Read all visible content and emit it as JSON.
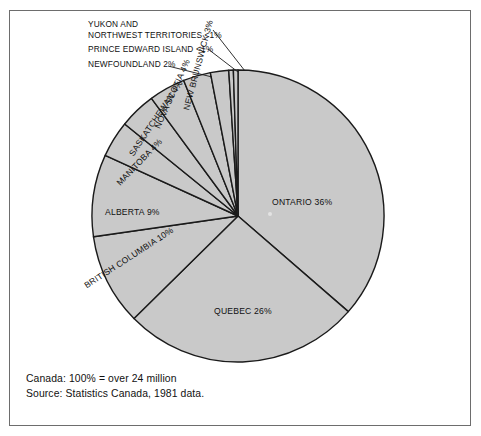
{
  "figure": {
    "border_color": "#6d6d6d",
    "background": "#ffffff"
  },
  "chart_data": {
    "type": "pie",
    "title": "",
    "subtitle": "",
    "units": "percent of population",
    "start_angle_deg": 0,
    "direction": "clockwise",
    "fill_color": "#c9c9c9",
    "stroke_color": "#1a1a1a",
    "center": {
      "x": 238,
      "y": 216
    },
    "radius": 146,
    "categories": [
      "ONTARIO",
      "QUEBEC",
      "BRITISH COLUMBIA",
      "ALBERTA",
      "MANITOBA",
      "SASKATCHEWAN",
      "NOVA SCOTIA",
      "NEW BRUNSWICK",
      "NEWFOUNDLAND",
      "PRINCE EDWARD ISLAND",
      "YUKON AND NORTHWEST TERRITORIES"
    ],
    "values": [
      36,
      26,
      10,
      9,
      4,
      4,
      4,
      3,
      2,
      0.5,
      0.5
    ],
    "value_labels": [
      "36%",
      "26%",
      "10%",
      "9%",
      "4%",
      "4%",
      "4%",
      "3%",
      "2%",
      "<1%",
      "<1%"
    ],
    "slices": [
      {
        "name": "ONTARIO",
        "value": 36,
        "label": "ONTARIO 36%"
      },
      {
        "name": "QUEBEC",
        "value": 26,
        "label": "QUEBEC 26%"
      },
      {
        "name": "BRITISH COLUMBIA",
        "value": 10,
        "label": "BRITISH COLUMBIA 10%"
      },
      {
        "name": "ALBERTA",
        "value": 9,
        "label": "ALBERTA 9%"
      },
      {
        "name": "MANITOBA",
        "value": 4,
        "label": "MANITOBA 4%"
      },
      {
        "name": "SASKATCHEWAN",
        "value": 4,
        "label": "SASKATCHEWAN 4%"
      },
      {
        "name": "NOVA SCOTIA",
        "value": 4,
        "label": "NOVA SCOTIA 4%"
      },
      {
        "name": "NEW BRUNSWICK",
        "value": 3,
        "label": "NEW BRUNSWICK 3%"
      },
      {
        "name": "NEWFOUNDLAND",
        "value": 2,
        "label": "NEWFOUNDLAND 2%"
      },
      {
        "name": "PRINCE EDWARD ISLAND",
        "value": 0.5,
        "label": "PRINCE EDWARD ISLAND <1%"
      },
      {
        "name": "YUKON AND NORTHWEST TERRITORIES",
        "value": 0.5,
        "label": "YUKON AND NORTHWEST TERRITORIES <1%"
      }
    ],
    "legend": "none",
    "grid": false
  },
  "callouts": {
    "yukon_line1": "YUKON AND",
    "yukon_line2": "NORTHWEST TERRITORIES <1%",
    "pei": "PRINCE EDWARD ISLAND <1%",
    "newfoundland": "NEWFOUNDLAND 2%"
  },
  "inline_labels": {
    "ontario": "ONTARIO 36%",
    "quebec": "QUEBEC 26%",
    "british_columbia": "BRITISH COLUMBIA 10%",
    "alberta": "ALBERTA 9%",
    "manitoba": "MANITOBA 4%",
    "saskatchewan": "SASKATCHEWAN 4%",
    "nova_scotia": "NOVA SCOTIA 4%",
    "new_brunswick": "NEW BRUNSWICK 3%"
  },
  "footer": {
    "total_line": "Canada: 100% = over 24 million",
    "source_line": "Source: Statistics Canada, 1981 data."
  }
}
